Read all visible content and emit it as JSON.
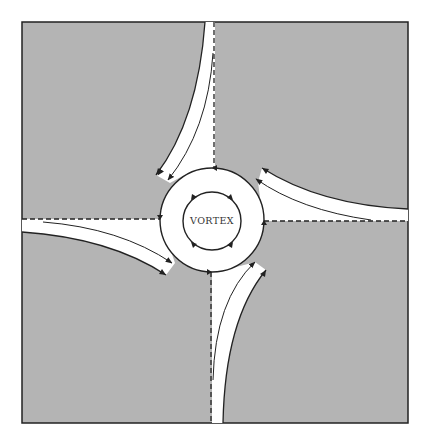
{
  "diagram": {
    "center_label": "VORTEX",
    "colors": {
      "background": "#ffffff",
      "shaded_region": "#b4b4b4",
      "channel": "#ffffff",
      "line": "#222222"
    }
  }
}
